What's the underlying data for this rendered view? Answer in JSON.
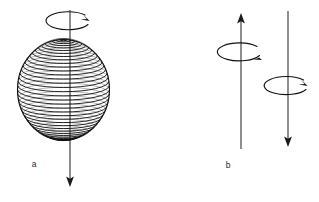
{
  "figure": {
    "title": "",
    "background_color": "#ffffff",
    "ink_color": "#111111",
    "panels": [
      {
        "id": "a",
        "label": "a",
        "label_x": 34,
        "label_y": 167,
        "description": "rotating sphere with latitude lines and downward spin axis",
        "sphere": {
          "center_x": 63.5,
          "center_y": 89.5,
          "radius_x": 46,
          "radius_y": 50,
          "latitude_line_count": 37
        },
        "axis": {
          "x": 70,
          "top_y": 10,
          "bottom_y": 186,
          "arrow_direction": "down"
        },
        "rotation_arrow": {
          "center_x": 68,
          "center_y": 21,
          "radius_x": 22,
          "radius_y": 9,
          "arrow_direction": "clockwise-from-above",
          "arrow_side": "right"
        }
      },
      {
        "id": "b",
        "label": "b",
        "label_x": 228,
        "label_y": 168,
        "description": "two antiparallel spin vectors with rotation arrows",
        "vectors": [
          {
            "name": "spin-up-vector",
            "x": 241,
            "top_y": 14,
            "bottom_y": 149,
            "arrow_direction": "up",
            "rotation_arrow": {
              "center_x": 240,
              "center_y": 51,
              "radius_x": 22,
              "radius_y": 9,
              "arrow_side": "right"
            }
          },
          {
            "name": "spin-down-vector",
            "x": 288,
            "top_y": 11,
            "bottom_y": 146,
            "arrow_direction": "down",
            "rotation_arrow": {
              "center_x": 287,
              "center_y": 86,
              "radius_x": 22,
              "radius_y": 9,
              "arrow_side": "right"
            }
          }
        ]
      }
    ]
  }
}
